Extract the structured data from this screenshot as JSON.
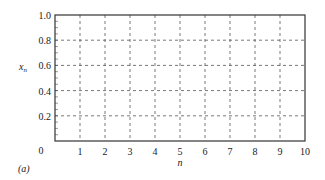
{
  "chart_data": {
    "type": "line",
    "title": "",
    "panel_label": "(a)",
    "xlabel": "n",
    "ylabel": "x_n",
    "ylabel_main": "x",
    "ylabel_sub": "n",
    "xlim": [
      0,
      10
    ],
    "ylim": [
      0,
      1.0
    ],
    "x_ticks": [
      1,
      2,
      3,
      4,
      5,
      6,
      7,
      8,
      9,
      10
    ],
    "x_tick_labels": [
      "1",
      "2",
      "3",
      "4",
      "5",
      "6",
      "7",
      "8",
      "9",
      "10"
    ],
    "y_ticks": [
      0,
      0.2,
      0.4,
      0.6,
      0.8,
      1.0
    ],
    "y_tick_labels": [
      "0",
      "0.2",
      "0.4",
      "0.6",
      "0.8",
      "1.0"
    ],
    "grid": true,
    "grid_style": "dashed",
    "series": []
  }
}
